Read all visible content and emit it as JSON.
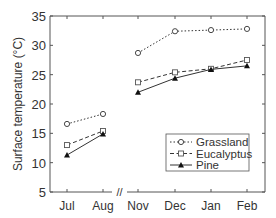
{
  "chart_data": {
    "type": "line",
    "title": "",
    "xlabel": "",
    "ylabel": "Surface temperature (°C)",
    "ylim": [
      5,
      35
    ],
    "yticks": [
      5,
      10,
      15,
      20,
      25,
      30,
      35
    ],
    "categories": [
      "Jul",
      "Aug",
      "Nov",
      "Dec",
      "Jan",
      "Feb"
    ],
    "axis_break_between": [
      "Aug",
      "Nov"
    ],
    "axis_break_label": "//",
    "grid": false,
    "legend_position": "lower right",
    "series": [
      {
        "name": "Grassland",
        "line_style": "dotted",
        "marker": "open-circle",
        "segments": [
          [
            16.6,
            18.3
          ],
          [
            28.7,
            32.4,
            32.6,
            32.8
          ]
        ],
        "values": [
          16.6,
          18.3,
          28.7,
          32.4,
          32.6,
          32.8
        ]
      },
      {
        "name": "Eucalyptus",
        "line_style": "dashed",
        "marker": "open-square",
        "values": [
          13.0,
          15.4,
          23.7,
          25.4,
          26.0,
          27.5
        ]
      },
      {
        "name": "Pine",
        "line_style": "solid",
        "marker": "filled-triangle",
        "values": [
          11.3,
          14.9,
          22.0,
          24.4,
          25.9,
          26.5
        ]
      }
    ]
  }
}
